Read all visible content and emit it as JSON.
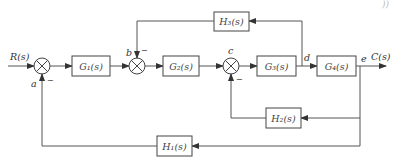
{
  "diagram": {
    "type": "control-system-block-diagram",
    "input_label": "R(s)",
    "output_label": "C(s)",
    "corner_text": "))",
    "blocks": {
      "G1": "G₁(s)",
      "G2": "G₂(s)",
      "G3": "G₃(s)",
      "G4": "G₄(s)",
      "H1": "H₁(s)",
      "H2": "H₂(s)",
      "H3": "H₃(s)"
    },
    "points": {
      "a": "a",
      "b": "b",
      "c": "c",
      "d": "d",
      "e": "e"
    },
    "signs": {
      "a": "−",
      "b": "−",
      "c": "−"
    },
    "connections": [
      {
        "from": "R(s)",
        "to": "a"
      },
      {
        "from": "a",
        "to": "G1"
      },
      {
        "from": "G1",
        "to": "b"
      },
      {
        "from": "b",
        "to": "G2"
      },
      {
        "from": "G2",
        "to": "c"
      },
      {
        "from": "c",
        "to": "G3"
      },
      {
        "from": "G3",
        "to": "d"
      },
      {
        "from": "d",
        "to": "G4"
      },
      {
        "from": "G4",
        "to": "e"
      },
      {
        "from": "e",
        "to": "C(s)"
      },
      {
        "from": "d",
        "to": "H3"
      },
      {
        "from": "H3",
        "to": "b",
        "sign": "-"
      },
      {
        "from": "e",
        "to": "H2"
      },
      {
        "from": "H2",
        "to": "c",
        "sign": "-"
      },
      {
        "from": "e",
        "to": "H1"
      },
      {
        "from": "H1",
        "to": "a",
        "sign": "-"
      }
    ]
  }
}
